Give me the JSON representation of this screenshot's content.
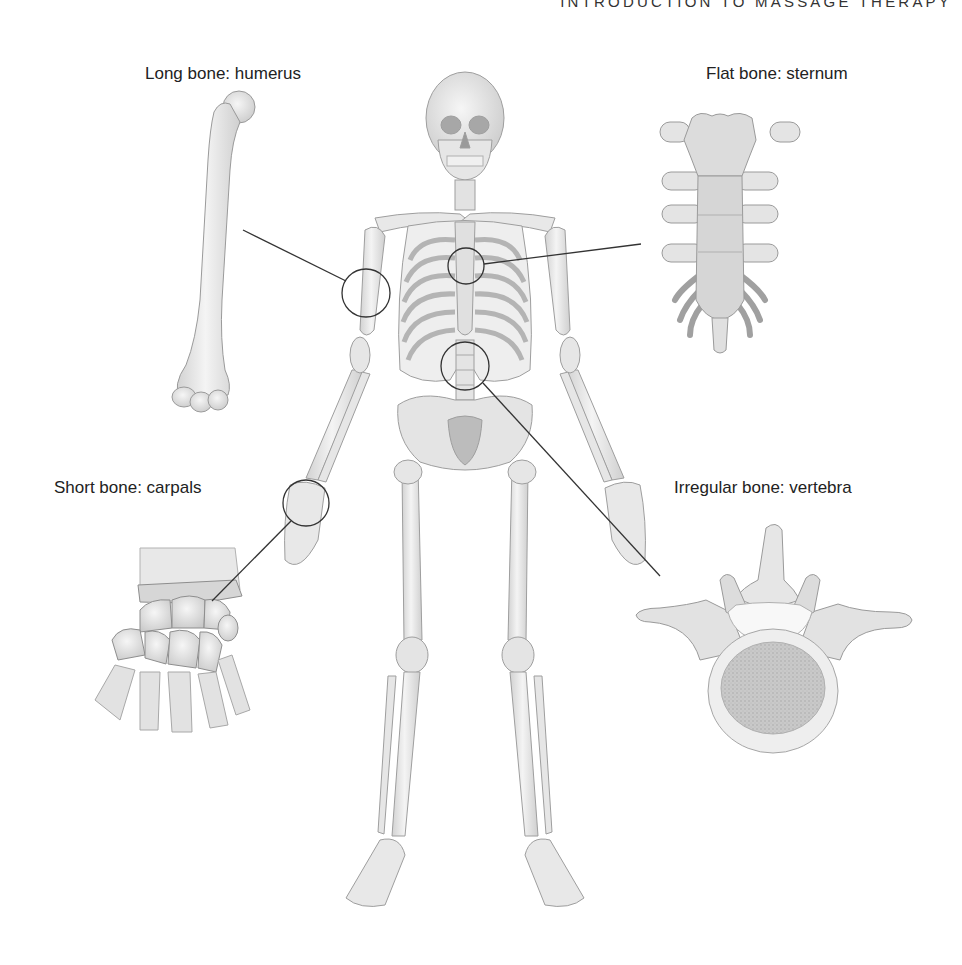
{
  "header": {
    "running_title": "INTRODUCTION TO MASSAGE THERAPY"
  },
  "figure": {
    "callouts": [
      {
        "id": "long",
        "label": "Long bone: humerus",
        "type": "Long bone",
        "example": "humerus"
      },
      {
        "id": "flat",
        "label": "Flat bone: sternum",
        "type": "Flat bone",
        "example": "sternum"
      },
      {
        "id": "short",
        "label": "Short bone: carpals",
        "type": "Short bone",
        "example": "carpals"
      },
      {
        "id": "irregular",
        "label": "Irregular bone: vertebra",
        "type": "Irregular bone",
        "example": "vertebra"
      }
    ]
  },
  "colors": {
    "bone_fill": "#ececec",
    "bone_stroke": "#9a9a9a",
    "bone_shadow": "#c4c4c4",
    "callout_line": "#333333",
    "text": "#222222"
  }
}
